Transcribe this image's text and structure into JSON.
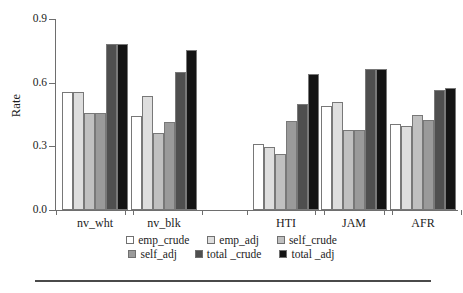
{
  "chart_data": {
    "type": "bar",
    "title": "",
    "xlabel": "",
    "ylabel": "Rate",
    "ylim": [
      0.0,
      0.9
    ],
    "yticks": [
      0.0,
      0.3,
      0.6,
      0.9
    ],
    "ytick_labels": [
      "0.0",
      "0.3",
      "0.6",
      "0.9"
    ],
    "grid": false,
    "legend_position": "bottom",
    "categories": [
      "nv_wht",
      "nv_blk",
      "HTI",
      "JAM",
      "AFR"
    ],
    "series": [
      {
        "name": "emp_crude",
        "color": "#ffffff",
        "values": [
          0.555,
          0.445,
          0.31,
          0.49,
          0.405
        ]
      },
      {
        "name": "emp_adj",
        "color": "#dedede",
        "values": [
          0.555,
          0.535,
          0.295,
          0.51,
          0.395
        ]
      },
      {
        "name": "self_crude",
        "color": "#c0c0c0",
        "values": [
          0.455,
          0.365,
          0.265,
          0.375,
          0.45
        ]
      },
      {
        "name": "self_adj",
        "color": "#9a9a9a",
        "values": [
          0.455,
          0.415,
          0.42,
          0.375,
          0.425
        ]
      },
      {
        "name": "total _crude",
        "color": "#4f4f4f",
        "values": [
          0.78,
          0.65,
          0.5,
          0.665,
          0.565
        ]
      },
      {
        "name": "total _adj",
        "color": "#141414",
        "values": [
          0.78,
          0.755,
          0.64,
          0.665,
          0.575
        ]
      }
    ]
  },
  "axis": {
    "y_label": "Rate",
    "y_ticks": [
      "0.0",
      "0.3",
      "0.6",
      "0.9"
    ],
    "x_labels": [
      "nv_wht",
      "nv_blk",
      "HTI",
      "JAM",
      "AFR"
    ]
  },
  "legend": {
    "rows": [
      [
        {
          "label": "emp_crude",
          "color": "#ffffff"
        },
        {
          "label": "emp_adj",
          "color": "#dedede"
        },
        {
          "label": "self_crude",
          "color": "#c0c0c0"
        }
      ],
      [
        {
          "label": "self_adj",
          "color": "#9a9a9a"
        },
        {
          "label": "total _crude",
          "color": "#4f4f4f"
        },
        {
          "label": "total _adj",
          "color": "#141414"
        }
      ]
    ]
  },
  "style": {
    "axis_color": "#6e6e6e",
    "bar_edge_color": "#787878",
    "rule_color": "#4a4a4a"
  }
}
